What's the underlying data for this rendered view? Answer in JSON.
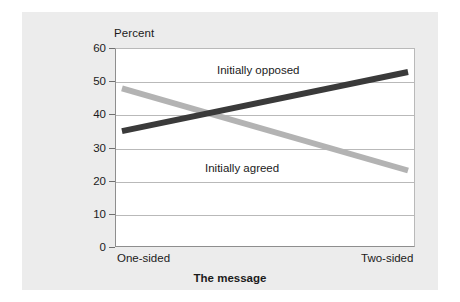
{
  "chart_data": {
    "type": "line",
    "title": "",
    "xlabel": "The message",
    "ylabel": "Percent",
    "ylim": [
      0,
      60
    ],
    "yticks": [
      60,
      50,
      40,
      30,
      20,
      10,
      0
    ],
    "grid": true,
    "legend_position": "inline-annotations",
    "categories": [
      "One-sided",
      "Two-sided"
    ],
    "series": [
      {
        "name": "Initially opposed",
        "color": "#3a3a3a",
        "values": [
          35,
          53
        ]
      },
      {
        "name": "Initially agreed",
        "color": "#b3b3b3",
        "values": [
          48,
          23
        ]
      }
    ],
    "annotations": [
      {
        "text": "Initially opposed",
        "series": "Initially opposed"
      },
      {
        "text": "Initially agreed",
        "series": "Initially agreed"
      }
    ]
  },
  "axes": {
    "y_label": "Percent",
    "x_label": "The message",
    "y_ticks": [
      "60",
      "50",
      "40",
      "30",
      "20",
      "10",
      "0"
    ],
    "x_ticks": [
      "One-sided",
      "Two-sided"
    ]
  },
  "labels": {
    "series_opposed": "Initially opposed",
    "series_agreed": "Initially agreed"
  },
  "colors": {
    "panel_background": "#ececec",
    "plot_background": "#ffffff",
    "gridline": "#b9b9b9",
    "axis": "#8e8e8e",
    "series_opposed": "#3a3a3a",
    "series_agreed": "#b3b3b3",
    "text": "#1b1b1b"
  }
}
